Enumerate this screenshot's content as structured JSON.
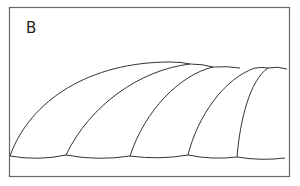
{
  "figure": {
    "panel_label": "B",
    "stroke_color": "#333333",
    "frame_color": "#666666"
  }
}
